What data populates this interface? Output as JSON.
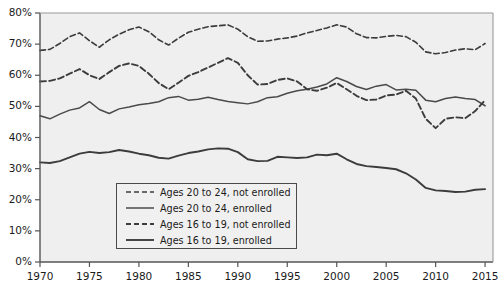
{
  "chart_data": {
    "type": "line",
    "title": "",
    "xlabel": "",
    "ylabel": "",
    "xlim": [
      1970,
      2015.8
    ],
    "ylim": [
      0,
      80
    ],
    "grid": false,
    "legend_position": "bottom-left",
    "x_ticks": [
      "1970",
      "1975",
      "1980",
      "1985",
      "1990",
      "1995",
      "2000",
      "2005",
      "2010",
      "2015"
    ],
    "x_tick_values": [
      1970,
      1975,
      1980,
      1985,
      1990,
      1995,
      2000,
      2005,
      2010,
      2015
    ],
    "y_ticks": [
      "0%",
      "10%",
      "20%",
      "30%",
      "40%",
      "50%",
      "60%",
      "70%",
      "80%"
    ],
    "y_tick_values": [
      0,
      10,
      20,
      30,
      40,
      50,
      60,
      70,
      80
    ],
    "x": [
      1970,
      1971,
      1972,
      1973,
      1974,
      1975,
      1976,
      1977,
      1978,
      1979,
      1980,
      1981,
      1982,
      1983,
      1984,
      1985,
      1986,
      1987,
      1988,
      1989,
      1990,
      1991,
      1992,
      1993,
      1994,
      1995,
      1996,
      1997,
      1998,
      1999,
      2000,
      2001,
      2002,
      2003,
      2004,
      2005,
      2006,
      2007,
      2008,
      2009,
      2010,
      2011,
      2012,
      2013,
      2014,
      2015
    ],
    "series": [
      {
        "name": "Ages 20 to 24, not enrolled",
        "style": "dashed",
        "color": "#3c3c3c",
        "values": [
          68.0,
          68.3,
          70.2,
          72.4,
          73.6,
          71.1,
          69.0,
          71.4,
          73.2,
          74.6,
          75.5,
          74.0,
          71.4,
          69.7,
          71.9,
          73.8,
          74.8,
          75.6,
          75.9,
          76.2,
          74.8,
          72.4,
          70.9,
          71.0,
          71.6,
          72.0,
          72.6,
          73.6,
          74.4,
          75.2,
          76.2,
          75.5,
          73.3,
          72.1,
          72.0,
          72.5,
          72.8,
          72.4,
          70.6,
          67.5,
          66.9,
          67.3,
          68.1,
          68.5,
          68.2,
          70.2
        ]
      },
      {
        "name": "Ages 20 to 24, enrolled",
        "style": "solid",
        "color": "#4a4a4a",
        "values": [
          47.0,
          46.0,
          47.5,
          48.8,
          49.5,
          51.5,
          49.0,
          47.7,
          49.2,
          49.8,
          50.5,
          50.9,
          51.5,
          52.8,
          53.2,
          52.0,
          52.3,
          52.9,
          52.2,
          51.6,
          51.2,
          50.8,
          51.5,
          52.8,
          53.1,
          54.2,
          55.0,
          55.5,
          56.2,
          57.2,
          59.2,
          58.0,
          56.4,
          55.4,
          56.5,
          57.0,
          55.3,
          55.5,
          55.2,
          52.0,
          51.5,
          52.5,
          53.0,
          52.5,
          52.2,
          50.2
        ]
      },
      {
        "name": "Ages 16 to 19, not enrolled",
        "style": "dashed",
        "color": "#3c3c3c",
        "values": [
          58.0,
          58.2,
          59.0,
          60.5,
          62.0,
          60.0,
          58.8,
          61.0,
          63.0,
          63.8,
          63.0,
          60.5,
          57.5,
          55.5,
          57.6,
          59.8,
          61.0,
          62.5,
          64.0,
          65.5,
          64.0,
          60.0,
          57.0,
          57.2,
          58.5,
          59.0,
          58.0,
          55.5,
          55.0,
          56.0,
          57.5,
          55.5,
          53.4,
          52.0,
          52.2,
          53.5,
          53.8,
          55.0,
          52.5,
          46.0,
          43.0,
          46.0,
          46.5,
          46.2,
          48.5,
          52.0
        ]
      },
      {
        "name": "Ages 16 to 19, enrolled",
        "style": "solid",
        "color": "#3c3c3c",
        "values": [
          32.0,
          31.8,
          32.4,
          33.6,
          34.8,
          35.4,
          35.0,
          35.3,
          36.0,
          35.5,
          34.8,
          34.3,
          33.5,
          33.2,
          34.2,
          35.0,
          35.5,
          36.2,
          36.5,
          36.4,
          35.3,
          33.0,
          32.4,
          32.5,
          33.8,
          33.6,
          33.4,
          33.6,
          34.5,
          34.3,
          34.8,
          33.0,
          31.5,
          30.8,
          30.5,
          30.2,
          29.8,
          28.5,
          26.5,
          23.8,
          23.0,
          22.8,
          22.5,
          22.6,
          23.2,
          23.4
        ]
      }
    ]
  }
}
